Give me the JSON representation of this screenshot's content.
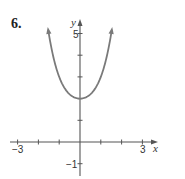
{
  "problem": {
    "number": "6."
  },
  "chart_data": {
    "type": "line",
    "title": "",
    "xlabel": "x",
    "ylabel": "y",
    "xlim": [
      -3.4,
      3.7
    ],
    "ylim": [
      -1.6,
      5.7
    ],
    "x_tick_labels": [
      "-3",
      "3"
    ],
    "y_tick_labels": [
      "5",
      "-1"
    ],
    "x_ticks": [
      -3,
      -2,
      -1,
      1,
      2,
      3
    ],
    "y_ticks": [
      -1,
      1,
      2,
      3,
      4,
      5
    ],
    "grid": false,
    "legend": null,
    "series": [
      {
        "name": "curve",
        "description": "U-shaped even function with minimum at (0, 2), arrows on both ends",
        "x": [
          -1.5,
          -1.3,
          -1.0,
          -0.5,
          0,
          0.5,
          1.0,
          1.3,
          1.5
        ],
        "y": [
          5.0,
          4.0,
          3.0,
          2.2,
          2.0,
          2.2,
          3.0,
          4.0,
          5.0
        ],
        "color": "#7a7a7a"
      }
    ],
    "annotations": [
      "vertex (0, 2)"
    ]
  },
  "labels": {
    "x_axis": "x",
    "y_axis": "y",
    "x_min_tick": "−3",
    "x_max_tick": "3",
    "y_max_tick": "5",
    "y_min_tick": "−1"
  },
  "colors": {
    "curve": "#7a7a7a",
    "axis": "#555555"
  }
}
